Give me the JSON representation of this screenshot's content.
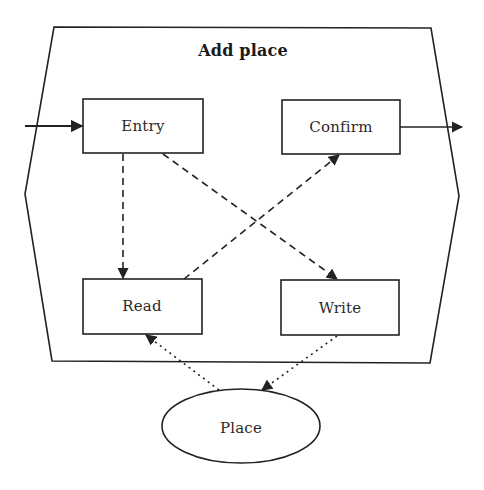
{
  "diagram": {
    "title": "Add place",
    "container": {
      "shape": "hexagon",
      "points": [
        [
          54,
          27
        ],
        [
          431,
          28
        ],
        [
          459,
          196
        ],
        [
          430,
          363
        ],
        [
          52,
          361
        ],
        [
          25,
          194
        ]
      ]
    },
    "nodes": [
      {
        "id": "entry",
        "label": "Entry",
        "shape": "rect",
        "x": 83,
        "y": 99,
        "w": 120,
        "h": 54
      },
      {
        "id": "confirm",
        "label": "Confirm",
        "shape": "rect",
        "x": 282,
        "y": 100,
        "w": 118,
        "h": 54
      },
      {
        "id": "read",
        "label": "Read",
        "shape": "rect",
        "x": 83,
        "y": 279,
        "w": 119,
        "h": 55
      },
      {
        "id": "write",
        "label": "Write",
        "shape": "rect",
        "x": 281,
        "y": 280,
        "w": 118,
        "h": 55
      },
      {
        "id": "place",
        "label": "Place",
        "shape": "ellipse",
        "cx": 241,
        "cy": 426,
        "rx": 79,
        "ry": 37
      }
    ],
    "edges": [
      {
        "from": "external",
        "to": "entry",
        "style": "solid"
      },
      {
        "from": "confirm",
        "to": "external",
        "style": "solid"
      },
      {
        "from": "entry",
        "to": "read",
        "style": "dashed"
      },
      {
        "from": "entry",
        "to": "write",
        "style": "dashed"
      },
      {
        "from": "read",
        "to": "confirm",
        "style": "dashed"
      },
      {
        "from": "place",
        "to": "read",
        "style": "dotted"
      },
      {
        "from": "write",
        "to": "place",
        "style": "dotted"
      }
    ],
    "colors": {
      "stroke": "#222222",
      "text": "#2a2a2a",
      "background": "#ffffff"
    }
  }
}
